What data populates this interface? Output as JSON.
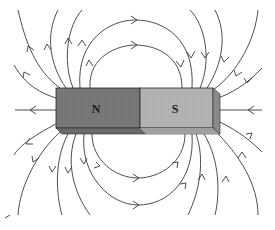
{
  "diagram": {
    "magnet": {
      "north_label": "N",
      "south_label": "S",
      "north_color": "#7a7a7a",
      "south_color": "#b4b4b4",
      "bottom_edge_color": "#555555",
      "side_face_color": "#8a8a8a"
    },
    "field_line_color": "#3a3a3a",
    "field_direction": "from N pole outward, returning into S pole"
  }
}
